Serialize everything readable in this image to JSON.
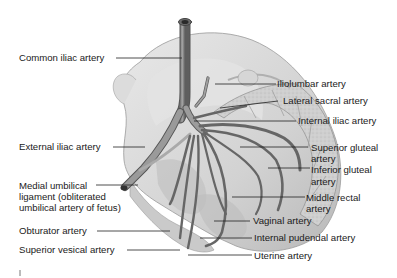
{
  "diagram": {
    "colors": {
      "background": "#ffffff",
      "bone": "#d9d9d9",
      "bone_shadow": "#a9a9a9",
      "artery": "#8c8c8c",
      "artery_dark": "#5a5a5a",
      "sacrum": "#c8c8c8",
      "leader_line": "#222222",
      "text": "#1a1a1a"
    },
    "labels_left": [
      {
        "id": "common-iliac",
        "text": "Common iliac artery"
      },
      {
        "id": "external-iliac",
        "text": "External iliac artery"
      },
      {
        "id": "medial-umbilical-1",
        "text": "Medial umbilical"
      },
      {
        "id": "medial-umbilical-2",
        "text": "ligament (obliterated"
      },
      {
        "id": "medial-umbilical-3",
        "text": "umbilical artery of fetus)"
      },
      {
        "id": "obturator",
        "text": "Obturator artery"
      },
      {
        "id": "superior-vesical",
        "text": "Superior vesical artery"
      }
    ],
    "labels_right": [
      {
        "id": "iliolumbar",
        "text": "Iliolumbar artery"
      },
      {
        "id": "lateral-sacral",
        "text": "Lateral sacral artery"
      },
      {
        "id": "internal-iliac",
        "text": "Internal iliac artery"
      },
      {
        "id": "superior-gluteal-1",
        "text": "Superior gluteal"
      },
      {
        "id": "superior-gluteal-2",
        "text": "artery"
      },
      {
        "id": "inferior-gluteal-1",
        "text": "Inferior gluteal"
      },
      {
        "id": "inferior-gluteal-2",
        "text": "artery"
      },
      {
        "id": "middle-rectal-1",
        "text": "Middle rectal"
      },
      {
        "id": "middle-rectal-2",
        "text": "artery"
      },
      {
        "id": "vaginal",
        "text": "Vaginal artery"
      },
      {
        "id": "internal-pudendal",
        "text": "Internal pudendal artery"
      },
      {
        "id": "uterine",
        "text": "Uterine artery"
      }
    ]
  }
}
